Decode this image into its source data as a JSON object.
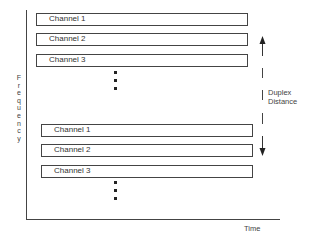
{
  "diagram": {
    "type": "frequency-time channel allocation",
    "axes": {
      "y_label": "Frequency",
      "x_label": "Time"
    },
    "upper_band": {
      "channels": [
        {
          "label": "Channel 1"
        },
        {
          "label": "Channel 2"
        },
        {
          "label": "Channel 3"
        }
      ],
      "continuation": "ellipsis"
    },
    "lower_band": {
      "channels": [
        {
          "label": "Channel 1"
        },
        {
          "label": "Channel 2"
        },
        {
          "label": "Channel 3"
        }
      ],
      "continuation": "ellipsis"
    },
    "annotation": {
      "line1": "Duplex",
      "line2": "Distance",
      "icon_up": "arrow-up-icon",
      "icon_down": "arrow-down-icon"
    },
    "colors": {
      "line": "#444444",
      "text": "#333333",
      "background": "#ffffff"
    }
  }
}
